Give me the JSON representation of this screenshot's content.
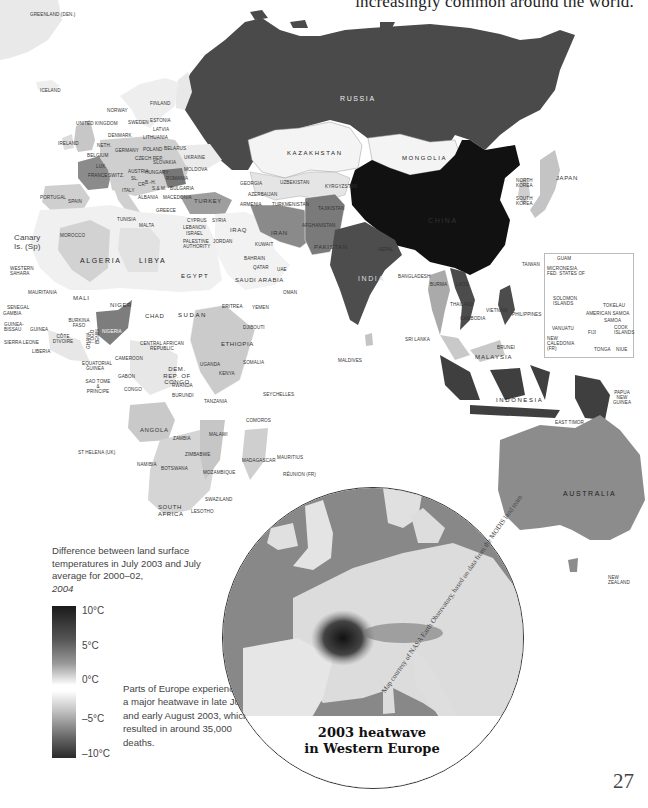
{
  "page": {
    "heading_fragment": "increasingly common around the world.",
    "page_number": "27"
  },
  "legend": {
    "caption": "Difference between land surface temperatures in July 2003 and July average for 2000–02,",
    "caption_year": "2004",
    "scale": [
      "10°C",
      "5°C",
      "0°C",
      "–5°C",
      "–10°C"
    ],
    "note": "Parts of Europe experienced a major heatwave in late July and early August 2003, which resulted in around 35,000 deaths."
  },
  "inset": {
    "title_line1": "2003 heatwave",
    "title_line2": "in Western Europe",
    "credit": "Map courtesy of NASA Earth Observatory, based on data from the MODIS land team"
  },
  "map": {
    "labels": {
      "greenland": "GREENLAND (Den.)",
      "iceland": "ICELAND",
      "norway": "NORWAY",
      "finland": "FINLAND",
      "sweden": "SWEDEN",
      "estonia": "ESTONIA",
      "latvia": "LATVIA",
      "lithuania": "LITHUANIA",
      "uk": "UNITED KINGDOM",
      "ireland": "IRELAND",
      "denmark": "DENMARK",
      "neth": "NETH.",
      "belgium": "BELGIUM",
      "lux": "LUX.",
      "germany": "GERMANY",
      "poland": "POLAND",
      "belarus": "BELARUS",
      "czech": "CZECH REP.",
      "slovakia": "SLOVAKIA",
      "ukraine": "UKRAINE",
      "moldova": "MOLDOVA",
      "france": "FRANCE",
      "switz": "SWITZ.",
      "austria": "AUSTRIA",
      "hungary": "HUNGARY",
      "romania": "ROMANIA",
      "sl": "SL.",
      "cr": "CR.",
      "bh": "B.-H.",
      "sm": "S.& M.",
      "bulgaria": "BULGARIA",
      "portugal": "PORTUGAL",
      "spain": "SPAIN",
      "italy": "ITALY",
      "albania": "ALBANIA",
      "macedonia": "MACEDONIA",
      "greece": "GREECE",
      "turkey": "TURKEY",
      "georgia": "GEORGIA",
      "azerbaijan": "AZERBAIJAN",
      "armenia": "ARMENIA",
      "russia": "RUSSIA",
      "kazakhstan": "KAZAKHSTAN",
      "mongolia": "MONGOLIA",
      "uzbekistan": "UZBEKISTAN",
      "kyrgyzstan": "KYRGYZSTAN",
      "turkmenistan": "TURKMENISTAN",
      "tajikistan": "TAJIKISTAN",
      "china": "CHINA",
      "north_korea": "NORTH KOREA",
      "south_korea": "SOUTH KOREA",
      "japan": "JAPAN",
      "tunisia": "TUNISIA",
      "malta": "MALTA",
      "cyprus": "CYPRUS",
      "syria": "SYRIA",
      "lebanon": "LEBANON",
      "israel": "ISRAEL",
      "palestine": "PALESTINE AUTHORITY",
      "jordan": "JORDAN",
      "iraq": "IRAQ",
      "iran": "IRAN",
      "afghanistan": "AFGHANISTAN",
      "pakistan": "PAKISTAN",
      "kuwait": "KUWAIT",
      "bahrain": "BAHRAIN",
      "qatar": "QATAR",
      "uae": "UAE",
      "saudi": "SAUDI ARABIA",
      "oman": "OMAN",
      "yemen": "YEMEN",
      "nepal": "NEPAL",
      "india": "INDIA",
      "bangladesh": "BANGLADESH",
      "burma": "BURMA",
      "laos": "LAOS",
      "thailand": "THAILAND",
      "cambodia": "CAMBODIA",
      "vietnam": "VIETNAM",
      "taiwan": "TAIWAN",
      "philippines": "PHILIPPINES",
      "sri_lanka": "SRI LANKA",
      "maldives": "MALDIVES",
      "malaysia": "MALAYSIA",
      "brunei": "BRUNEI",
      "indonesia": "INDONESIA",
      "east_timor": "EAST TIMOR",
      "png": "PAPUA NEW GUINEA",
      "australia": "AUSTRALIA",
      "new_zealand": "NEW ZEALAND",
      "canary": "Canary Is. (Sp)",
      "morocco": "MOROCCO",
      "algeria": "ALGERIA",
      "libya": "LIBYA",
      "egypt": "EGYPT",
      "western_sahara": "WESTERN SAHARA",
      "mauritania": "MAURITANIA",
      "mali": "MALI",
      "niger": "NIGER",
      "chad": "CHAD",
      "sudan": "SUDAN",
      "eritrea": "ERITREA",
      "djibouti": "DJIBOUTI",
      "ethiopia": "ETHIOPIA",
      "somalia": "SOMALIA",
      "senegal": "SENEGAL",
      "gambia": "GAMBIA",
      "guinea_bissau": "GUINEA-BISSAU",
      "guinea": "GUINEA",
      "sierra_leone": "SIERRA LEONE",
      "liberia": "LIBERIA",
      "cote": "CÔTE D'IVOIRE",
      "burkina": "BURKINA FASO",
      "ghana": "GHANA",
      "togo": "TOGO",
      "benin": "BENIN",
      "nigeria": "NIGERIA",
      "car": "CENTRAL AFRICAN REPUBLIC",
      "cameroon": "CAMEROON",
      "eq_guinea": "EQUATORIAL GUINEA",
      "sao_tome": "SAO TOME & PRINCIPE",
      "gabon": "GABON",
      "congo": "CONGO",
      "drc": "DEM. REP. OF CONGO",
      "uganda": "UGANDA",
      "kenya": "KENYA",
      "rwanda": "RWANDA",
      "burundi": "BURUNDI",
      "tanzania": "TANZANIA",
      "seychelles": "SEYCHELLES",
      "comoros": "COMOROS",
      "angola": "ANGOLA",
      "zambia": "ZAMBIA",
      "malawi": "MALAWI",
      "st_helena": "ST HELENA (UK)",
      "zimbabwe": "ZIMBABWE",
      "namibia": "NAMIBIA",
      "botswana": "BOTSWANA",
      "mozambique": "MOZAMBIQUE",
      "madagascar": "MADAGASCAR",
      "mauritius": "MAURITIUS",
      "reunion": "RÉUNION (Fr)",
      "swaziland": "SWAZILAND",
      "south_africa": "SOUTH AFRICA",
      "lesotho": "LESOTHO",
      "guam": "GUAM",
      "micronesia": "MICRONESIA, FED. STATES OF",
      "solomon": "SOLOMON ISLANDS",
      "tokelau": "TOKELAU",
      "american_samoa": "AMERICAN SAMOA",
      "samoa": "SAMOA",
      "vanuatu": "VANUATU",
      "fiji": "FIJI",
      "cook": "COOK ISLANDS",
      "new_caledonia": "NEW CALEDONIA (Fr)",
      "tonga": "TONGA",
      "niue": "NIUE"
    }
  }
}
